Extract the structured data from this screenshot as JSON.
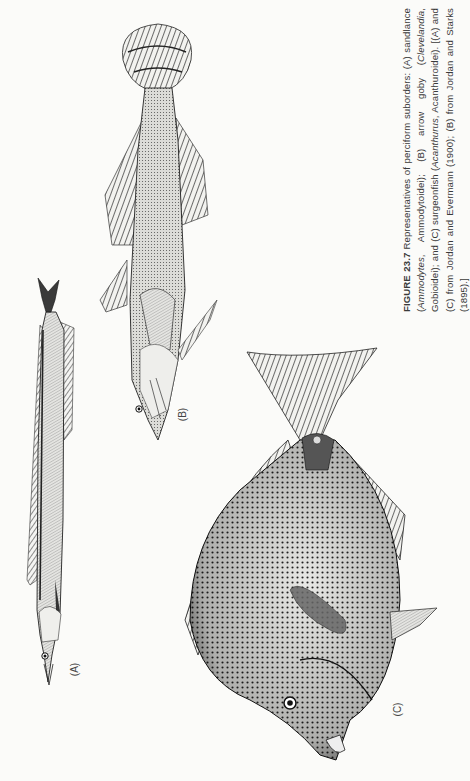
{
  "figure": {
    "number": "FIGURE 23.7",
    "caption_parts": [
      {
        "type": "text",
        "text": "Representatives of perciform suborders: (A) sandlance ("
      },
      {
        "type": "italic",
        "text": "Ammodytes"
      },
      {
        "type": "text",
        "text": ", Ammodytoidei); (B) arrow goby ("
      },
      {
        "type": "italic",
        "text": "Clevelandia"
      },
      {
        "type": "text",
        "text": ", Gobioidei); and (C) surgeonfish ("
      },
      {
        "type": "italic",
        "text": "Acanthurus"
      },
      {
        "type": "text",
        "text": ", Acanthuroidei). [(A) and (C) from Jordan and Evermann (1900); (B) from Jordan and Starks (1895).]"
      }
    ],
    "panels": [
      {
        "id": "A",
        "label": "(A)",
        "subject": "sandlance"
      },
      {
        "id": "B",
        "label": "(B)",
        "subject": "arrow goby"
      },
      {
        "id": "C",
        "label": "(C)",
        "subject": "surgeonfish"
      }
    ]
  },
  "colors": {
    "paper": "#fbfbf9",
    "ink": "#2a2a2a"
  }
}
